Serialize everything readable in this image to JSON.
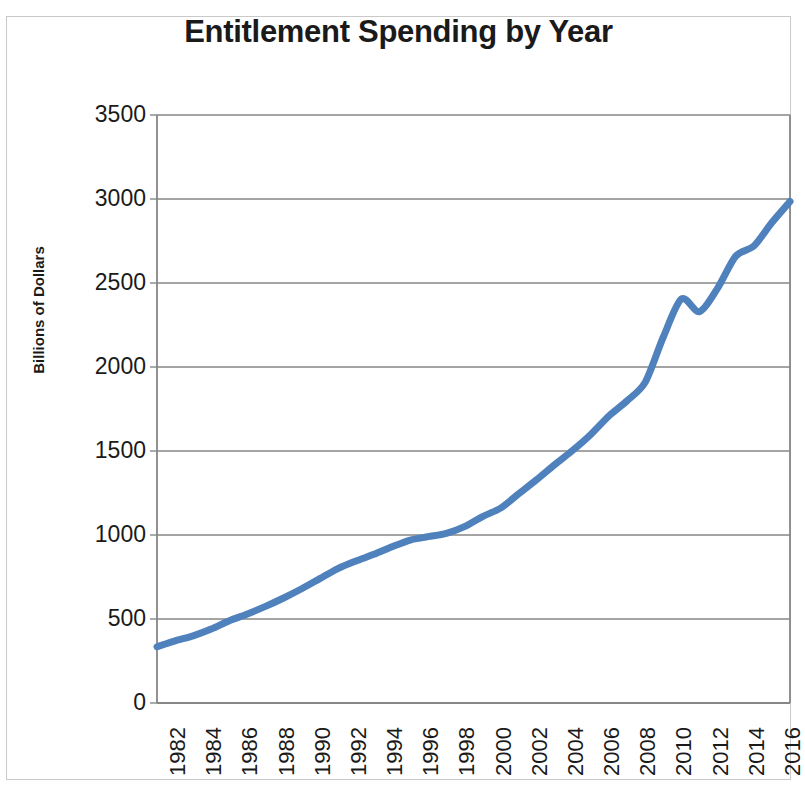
{
  "chart_data": {
    "type": "line",
    "title": "Entitlement Spending by Year",
    "xlabel": "",
    "ylabel": "Billions of Dollars",
    "ylim": [
      0,
      3500
    ],
    "xlim": [
      1982,
      2017
    ],
    "ytick_values": [
      0,
      500,
      1000,
      1500,
      2000,
      2500,
      3000,
      3500
    ],
    "ytick_labels": [
      "0",
      "500",
      "1000",
      "1500",
      "2000",
      "2500",
      "3000",
      "3500"
    ],
    "xtick_labels": [
      "1982",
      "1984",
      "1986",
      "1988",
      "1990",
      "1992",
      "1994",
      "1996",
      "1998",
      "2000",
      "2002",
      "2004",
      "2006",
      "2008",
      "2010",
      "2012",
      "2014",
      "2016"
    ],
    "grid": "horizontal",
    "legend": "none",
    "line_color": "#4F81BD",
    "line_width": 7,
    "x": [
      1982,
      1983,
      1984,
      1985,
      1986,
      1987,
      1988,
      1989,
      1990,
      1991,
      1992,
      1993,
      1994,
      1995,
      1996,
      1997,
      1998,
      1999,
      2000,
      2001,
      2002,
      2003,
      2004,
      2005,
      2006,
      2007,
      2008,
      2009,
      2010,
      2011,
      2012,
      2013,
      2014,
      2015,
      2016,
      2017
    ],
    "series": [
      {
        "name": "Entitlement Spending",
        "values": [
          335,
          370,
          400,
          440,
          490,
          530,
          575,
          625,
          680,
          740,
          800,
          845,
          885,
          930,
          970,
          990,
          1010,
          1050,
          1110,
          1160,
          1245,
          1330,
          1420,
          1505,
          1600,
          1710,
          1800,
          1910,
          2180,
          2405,
          2330,
          2470,
          2660,
          2720,
          2860,
          2985
        ]
      }
    ]
  },
  "axes": {
    "y_title": "Billions of Dollars"
  }
}
